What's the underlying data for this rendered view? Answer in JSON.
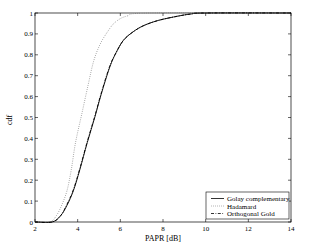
{
  "chart_data": {
    "type": "line",
    "title": "",
    "xlabel": "PAPR [dB]",
    "ylabel": "cdf",
    "xlim": [
      2,
      14
    ],
    "ylim": [
      0,
      1
    ],
    "xticks": [
      2,
      4,
      6,
      8,
      10,
      12,
      14
    ],
    "yticks": [
      0,
      0.1,
      0.2,
      0.3,
      0.4,
      0.5,
      0.6,
      0.7,
      0.8,
      0.9,
      1
    ],
    "grid": false,
    "legend_position": "lower right",
    "series": [
      {
        "name": "Golay complementary",
        "style": "solid",
        "color": "#000000",
        "x": [
          2,
          2.8,
          3.2,
          3.5,
          3.8,
          4.1,
          4.45,
          4.8,
          5.1,
          5.5,
          5.8,
          6.15,
          6.6,
          7.1,
          7.8,
          8.7,
          9.3,
          10,
          14
        ],
        "y": [
          0,
          0,
          0.03,
          0.08,
          0.15,
          0.25,
          0.38,
          0.5,
          0.61,
          0.74,
          0.81,
          0.87,
          0.91,
          0.94,
          0.965,
          0.985,
          0.995,
          1.0,
          1.0
        ]
      },
      {
        "name": "Hadamard",
        "style": "dotted",
        "color": "#777777",
        "x": [
          2,
          2.7,
          3.0,
          3.25,
          3.5,
          3.7,
          3.9,
          4.2,
          4.5,
          4.75,
          5.05,
          5.4,
          5.75,
          6.3,
          7.4,
          14
        ],
        "y": [
          0,
          0,
          0.03,
          0.08,
          0.15,
          0.25,
          0.38,
          0.52,
          0.66,
          0.77,
          0.85,
          0.91,
          0.955,
          0.985,
          1.0,
          1.0
        ]
      },
      {
        "name": "Orthogonal Gold",
        "style": "dashdot",
        "color": "#000000",
        "x": [
          2,
          2.8,
          3.2,
          3.5,
          3.8,
          4.1,
          4.45,
          4.8,
          5.1,
          5.5,
          5.8,
          6.15,
          6.6,
          7.1,
          7.8,
          8.7,
          9.3,
          10,
          14
        ],
        "y": [
          0,
          0,
          0.03,
          0.085,
          0.155,
          0.255,
          0.385,
          0.505,
          0.615,
          0.745,
          0.81,
          0.87,
          0.91,
          0.94,
          0.965,
          0.985,
          0.995,
          1.0,
          1.0
        ]
      }
    ]
  },
  "axes": {
    "xlabel": "PAPR [dB]",
    "ylabel": "cdf"
  },
  "legend": {
    "items": [
      {
        "label": "Golay complementary",
        "style": "solid"
      },
      {
        "label": "Hadamard",
        "style": "dotted"
      },
      {
        "label": "Orthogonal Gold",
        "style": "dashdot"
      }
    ]
  }
}
